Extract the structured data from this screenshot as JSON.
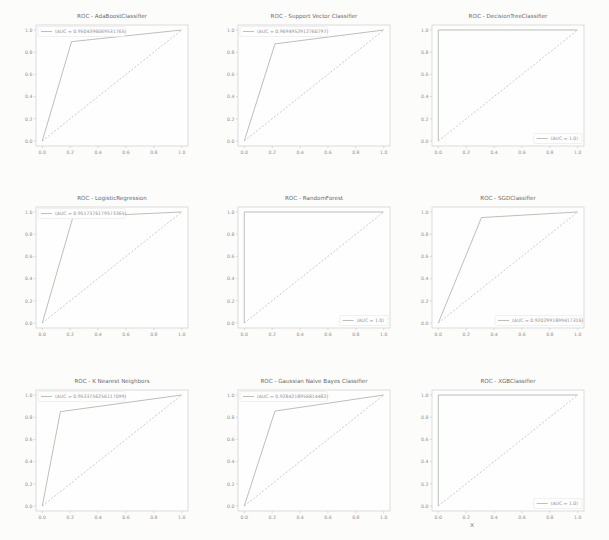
{
  "figure": {
    "background": "#fcfcfb",
    "plot_background": "#fefefe",
    "axis_color": "#c6c6c6",
    "title_color": "#6b6b6b",
    "tick_color": "#8f8f8f",
    "roc_color": "#a7b1a6",
    "diagonal_color": "#c4bbba",
    "legend_text_color": "#8f8f8f",
    "legend_border_color": "#e3e3e3",
    "stray_mark": "x"
  },
  "chart_data": [
    {
      "type": "line",
      "id": "adaboost",
      "title": "ROC - AdaBoostClassifier",
      "xlabel": "",
      "ylabel": "",
      "xlim": [
        0,
        1
      ],
      "ylim": [
        0,
        1
      ],
      "grid": false,
      "xticks": [
        "0.0",
        "0.2",
        "0.4",
        "0.6",
        "0.8",
        "1.0"
      ],
      "yticks": [
        "0.0",
        "0.2",
        "0.4",
        "0.6",
        "0.8",
        "1.0"
      ],
      "legend": {
        "label": "(AUC = 0.9504396069531765)",
        "position": "upper left"
      },
      "series": [
        {
          "name": "roc",
          "style": "solid",
          "x": [
            0,
            0.21,
            1.0
          ],
          "y": [
            0,
            0.895,
            1.0
          ]
        },
        {
          "name": "chance",
          "style": "dashed",
          "x": [
            0,
            1
          ],
          "y": [
            0,
            1
          ]
        }
      ]
    },
    {
      "type": "line",
      "id": "svc",
      "title": "ROC - Support Vector Classifier",
      "xlabel": "",
      "ylabel": "",
      "xlim": [
        0,
        1
      ],
      "ylim": [
        0,
        1
      ],
      "grid": false,
      "xticks": [
        "0.0",
        "0.2",
        "0.4",
        "0.6",
        "0.8",
        "1.0"
      ],
      "yticks": [
        "0.0",
        "0.2",
        "0.4",
        "0.6",
        "0.8",
        "1.0"
      ],
      "legend": {
        "label": "(AUC = 0.9694952912760797)",
        "position": "upper left"
      },
      "series": [
        {
          "name": "roc",
          "style": "solid",
          "x": [
            0,
            0.22,
            1.0
          ],
          "y": [
            0,
            0.875,
            1.0
          ]
        },
        {
          "name": "chance",
          "style": "dashed",
          "x": [
            0,
            1
          ],
          "y": [
            0,
            1
          ]
        }
      ]
    },
    {
      "type": "line",
      "id": "decision-tree",
      "title": "ROC - DecisionTreeClassifier",
      "xlabel": "",
      "ylabel": "",
      "xlim": [
        0,
        1
      ],
      "ylim": [
        0,
        1
      ],
      "grid": false,
      "xticks": [
        "0.0",
        "0.2",
        "0.4",
        "0.6",
        "0.8",
        "1.0"
      ],
      "yticks": [
        "0.0",
        "0.2",
        "0.4",
        "0.6",
        "0.8",
        "1.0"
      ],
      "legend": {
        "label": "(AUC = 1.0)",
        "position": "lower right"
      },
      "series": [
        {
          "name": "roc",
          "style": "solid",
          "x": [
            0,
            0,
            1.0
          ],
          "y": [
            0,
            1.0,
            1.0
          ]
        },
        {
          "name": "chance",
          "style": "dashed",
          "x": [
            0,
            1
          ],
          "y": [
            0,
            1
          ]
        }
      ]
    },
    {
      "type": "line",
      "id": "logistic-regression",
      "title": "ROC - LogisticRegression",
      "xlabel": "",
      "ylabel": "",
      "xlim": [
        0,
        1
      ],
      "ylim": [
        0,
        1
      ],
      "grid": false,
      "xticks": [
        "0.0",
        "0.2",
        "0.4",
        "0.6",
        "0.8",
        "1.0"
      ],
      "yticks": [
        "0.0",
        "0.2",
        "0.4",
        "0.6",
        "0.8",
        "1.0"
      ],
      "legend": {
        "label": "(AUC = 0.9517376179573365)",
        "position": "upper left"
      },
      "series": [
        {
          "name": "roc",
          "style": "solid",
          "x": [
            0,
            0.22,
            1.0
          ],
          "y": [
            0,
            0.955,
            1.0
          ]
        },
        {
          "name": "chance",
          "style": "dashed",
          "x": [
            0,
            1
          ],
          "y": [
            0,
            1
          ]
        }
      ]
    },
    {
      "type": "line",
      "id": "random-forest",
      "title": "ROC - RandomForest",
      "xlabel": "",
      "ylabel": "",
      "xlim": [
        0,
        1
      ],
      "ylim": [
        0,
        1
      ],
      "grid": false,
      "xticks": [
        "0.0",
        "0.2",
        "0.4",
        "0.6",
        "0.8",
        "1.0"
      ],
      "yticks": [
        "0.0",
        "0.2",
        "0.4",
        "0.6",
        "0.8",
        "1.0"
      ],
      "legend": {
        "label": "(AUC = 1.0)",
        "position": "lower right"
      },
      "series": [
        {
          "name": "roc",
          "style": "solid",
          "x": [
            0,
            0,
            1.0
          ],
          "y": [
            0,
            1.0,
            1.0
          ]
        },
        {
          "name": "chance",
          "style": "dashed",
          "x": [
            0,
            1
          ],
          "y": [
            0,
            1
          ]
        }
      ]
    },
    {
      "type": "line",
      "id": "sgd",
      "title": "ROC - SGDClassifier",
      "xlabel": "",
      "ylabel": "",
      "xlim": [
        0,
        1
      ],
      "ylim": [
        0,
        1
      ],
      "grid": false,
      "xticks": [
        "0.0",
        "0.2",
        "0.4",
        "0.6",
        "0.8",
        "1.0"
      ],
      "yticks": [
        "0.0",
        "0.2",
        "0.4",
        "0.6",
        "0.8",
        "1.0"
      ],
      "legend": {
        "label": "(AUC = 0.9202991899417316)",
        "position": "lower right"
      },
      "series": [
        {
          "name": "roc",
          "style": "solid",
          "x": [
            0,
            0.31,
            1.0
          ],
          "y": [
            0,
            0.95,
            1.0
          ]
        },
        {
          "name": "chance",
          "style": "dashed",
          "x": [
            0,
            1
          ],
          "y": [
            0,
            1
          ]
        }
      ]
    },
    {
      "type": "line",
      "id": "knn",
      "title": "ROC - K Nearest Neighbors",
      "xlabel": "",
      "ylabel": "",
      "xlim": [
        0,
        1
      ],
      "ylim": [
        0,
        1
      ],
      "grid": false,
      "xticks": [
        "0.0",
        "0.2",
        "0.4",
        "0.6",
        "0.8",
        "1.0"
      ],
      "yticks": [
        "0.0",
        "0.2",
        "0.4",
        "0.6",
        "0.8",
        "1.0"
      ],
      "legend": {
        "label": "(AUC = 0.9533756256117099)",
        "position": "upper left"
      },
      "series": [
        {
          "name": "roc",
          "style": "solid",
          "x": [
            0,
            0.13,
            1.0
          ],
          "y": [
            0,
            0.85,
            1.0
          ]
        },
        {
          "name": "chance",
          "style": "dashed",
          "x": [
            0,
            1
          ],
          "y": [
            0,
            1
          ]
        }
      ]
    },
    {
      "type": "line",
      "id": "gaussian-nb",
      "title": "ROC - Gaussian Naive Bayes Classifier",
      "xlabel": "",
      "ylabel": "",
      "xlim": [
        0,
        1
      ],
      "ylim": [
        0,
        1
      ],
      "grid": false,
      "xticks": [
        "0.0",
        "0.2",
        "0.4",
        "0.6",
        "0.8",
        "1.0"
      ],
      "yticks": [
        "0.0",
        "0.2",
        "0.4",
        "0.6",
        "0.8",
        "1.0"
      ],
      "legend": {
        "label": "(AUC = 0.9284218956814482)",
        "position": "upper left"
      },
      "series": [
        {
          "name": "roc",
          "style": "solid",
          "x": [
            0,
            0.22,
            1.0
          ],
          "y": [
            0,
            0.855,
            1.0
          ]
        },
        {
          "name": "chance",
          "style": "dashed",
          "x": [
            0,
            1
          ],
          "y": [
            0,
            1
          ]
        }
      ]
    },
    {
      "type": "line",
      "id": "xgb",
      "title": "ROC - XGBClassifier",
      "xlabel": "",
      "ylabel": "",
      "xlim": [
        0,
        1
      ],
      "ylim": [
        0,
        1
      ],
      "grid": false,
      "xticks": [
        "0.0",
        "0.2",
        "0.4",
        "0.6",
        "0.8",
        "1.0"
      ],
      "yticks": [
        "0.0",
        "0.2",
        "0.4",
        "0.6",
        "0.8",
        "1.0"
      ],
      "legend": {
        "label": "(AUC = 1.0)",
        "position": "lower right"
      },
      "series": [
        {
          "name": "roc",
          "style": "solid",
          "x": [
            0,
            0,
            1.0
          ],
          "y": [
            0,
            1.0,
            1.0
          ]
        },
        {
          "name": "chance",
          "style": "dashed",
          "x": [
            0,
            1
          ],
          "y": [
            0,
            1
          ]
        }
      ]
    }
  ]
}
